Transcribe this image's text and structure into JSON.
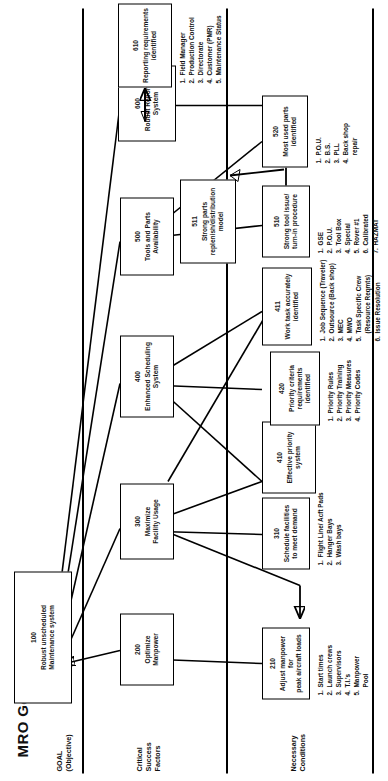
{
  "title": "MRO Goal Tree",
  "bands": [
    {
      "id": "goal",
      "label": "GOAL\n(Objective)"
    },
    {
      "id": "csf",
      "label": "Critical\nSuccess\nFactors"
    },
    {
      "id": "nc",
      "label": "Necessary\nConditions"
    }
  ],
  "nodes": [
    {
      "id": "n100",
      "num": "100",
      "title": "Robust unscheduled\nMaintenance system",
      "level": 1
    },
    {
      "id": "n200",
      "num": "200",
      "title": "Optimize\nManpower",
      "level": 2
    },
    {
      "id": "n300",
      "num": "300",
      "title": "Maximize\nFacility Usage",
      "level": 2
    },
    {
      "id": "n400",
      "num": "400",
      "title": "Enhanced Scheduling\nSystem",
      "level": 2
    },
    {
      "id": "n500",
      "num": "500",
      "title": "Tools and Parts\nAvailability",
      "level": 2
    },
    {
      "id": "n600",
      "num": "600",
      "title": "Robust Reporting\nSystem",
      "level": 2
    },
    {
      "id": "n210",
      "num": "210",
      "title": "Adjust manpower for\npeak aircraft loads",
      "level": 3
    },
    {
      "id": "n310",
      "num": "310",
      "title": "Schedule facilities\nto meet demand",
      "level": 3
    },
    {
      "id": "n410",
      "num": "410",
      "title": "Effective priority\nsystem",
      "level": 3
    },
    {
      "id": "n420",
      "num": "420",
      "title": "Priority criteria\nrequirements\nidentified",
      "level": 3
    },
    {
      "id": "n411",
      "num": "411",
      "title": "Work task accurately\nidentified",
      "level": 3
    },
    {
      "id": "n510",
      "num": "510",
      "title": "Strong tool issue/\nturn-in procedure",
      "level": 3
    },
    {
      "id": "n511",
      "num": "511",
      "title": "Strong parts\nreplenish/distribution\nmodel",
      "level": 3
    },
    {
      "id": "n520",
      "num": "520",
      "title": "Most used parts\nidentified",
      "level": 3
    },
    {
      "id": "n610",
      "num": "610",
      "title": "Reporting requirements\nidentified",
      "level": 3
    }
  ],
  "sublists": [
    {
      "id": "l210",
      "owner": "210",
      "items": [
        "Start times",
        "Launch crews",
        "Supervisors",
        "T.I.'s",
        "Manpower\nPool"
      ]
    },
    {
      "id": "l310",
      "owner": "310",
      "items": [
        "Flight Line/ Acft Pads",
        "Hanger Bays",
        "Wash bays"
      ]
    },
    {
      "id": "l420",
      "owner": "420",
      "items": [
        "Priority Rules",
        "Priority Training",
        "Priority Measures",
        "Priority Codes"
      ]
    },
    {
      "id": "l411",
      "owner": "411",
      "items": [
        "Job Sequence (Traveler)",
        "Outsource (Back shop)",
        "MEC",
        "MWO",
        "Task Specific Crew\n(Resource Reqmts)",
        "Issue Resolution"
      ]
    },
    {
      "id": "l510",
      "owner": "510",
      "items": [
        "GSE",
        "P.O.U.",
        "Tool Box",
        "Special",
        "Rover #1",
        "Calibrated",
        "HAZMAT"
      ]
    },
    {
      "id": "l520",
      "owner": "520",
      "items": [
        "P.O.U.",
        "B.S.",
        "PLL",
        "Back shop\nrepair"
      ]
    },
    {
      "id": "l610",
      "owner": "610",
      "items": [
        "Field Manager",
        "Production Control",
        "Directorate",
        "Customer (PMR)",
        "Maintenance Status"
      ]
    }
  ],
  "colors": {
    "ink": "#000000",
    "background": "#ffffff",
    "text": "#1a1a1a"
  }
}
